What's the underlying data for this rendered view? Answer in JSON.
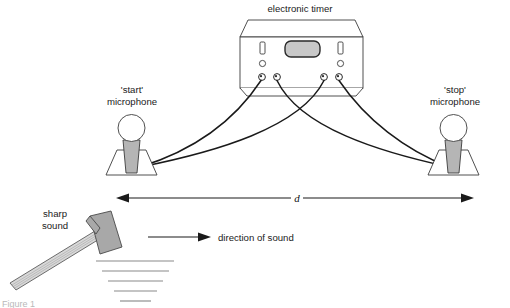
{
  "figure": {
    "title_label": "electronic timer",
    "start_mic_label_line1": "'start'",
    "start_mic_label_line2": "microphone",
    "stop_mic_label_line1": "'stop'",
    "stop_mic_label_line2": "microphone",
    "distance_label": "d",
    "sharp_sound_line1": "sharp",
    "sharp_sound_line2": "sound",
    "direction_label": "direction of sound",
    "caption_partial": "Figure 1"
  },
  "colors": {
    "stroke": "#3c3c3c",
    "wire": "#1a1a1a",
    "display_fill": "#c8c8c8",
    "mic_body_fill": "#b5b5b5",
    "hammer_head_fill": "#a8a8a8",
    "hammer_handle_fill": "#d8d8d8",
    "ground_line": "#8a8a8a",
    "text": "#1a1a1a",
    "background": "#ffffff"
  }
}
